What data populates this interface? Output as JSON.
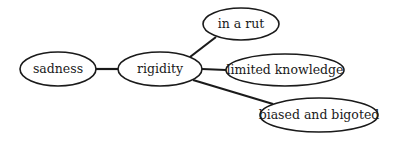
{
  "diagram": {
    "type": "mind-map",
    "nodes": [
      {
        "id": "sadness",
        "label": "sadness"
      },
      {
        "id": "rigidity",
        "label": "rigidity"
      },
      {
        "id": "rut",
        "label": "in a rut"
      },
      {
        "id": "limited",
        "label": "limited knowledge"
      },
      {
        "id": "biased",
        "label": "biased and bigoted"
      }
    ],
    "edges": [
      {
        "from": "sadness",
        "to": "rigidity"
      },
      {
        "from": "rigidity",
        "to": "rut"
      },
      {
        "from": "rigidity",
        "to": "limited"
      },
      {
        "from": "rigidity",
        "to": "biased"
      }
    ]
  }
}
